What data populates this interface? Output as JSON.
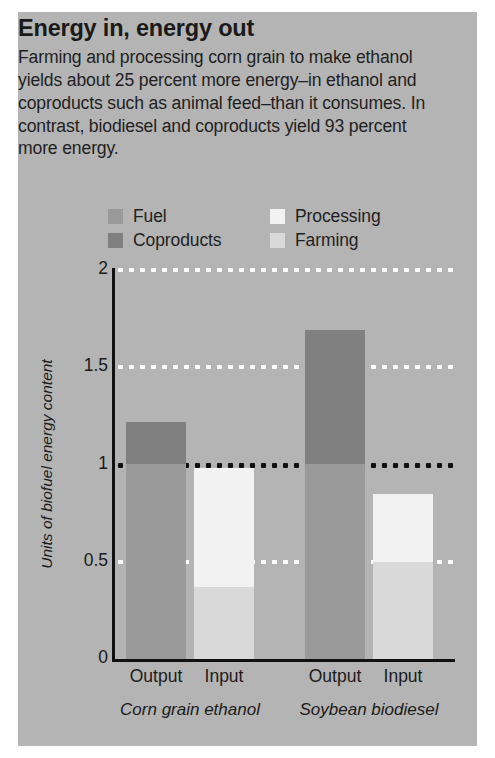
{
  "panel": {
    "background_color": "#b4b4b4"
  },
  "headline": {
    "title": "Energy in, energy out",
    "body": "Farming and processing corn grain to make ethanol yields about 25 percent more energy–in ethanol and coproducts such as animal feed–than it consumes. In contrast, biodiesel and coproducts yield 93 percent more energy."
  },
  "chart_data": {
    "type": "bar",
    "subtype": "stacked",
    "title": "Energy in, energy out",
    "xlabel": "",
    "ylabel": "Units of biofuel energy content",
    "ylim": [
      0,
      2
    ],
    "yticks": [
      "0",
      "0.5",
      "1",
      "1.5",
      "2"
    ],
    "ytick_values": [
      0,
      0.5,
      1,
      1.5,
      2
    ],
    "grid": true,
    "gridlines": [
      {
        "value": 2,
        "color": "#ffffff",
        "style": "dotted"
      },
      {
        "value": 1.5,
        "color": "#ffffff",
        "style": "dotted"
      },
      {
        "value": 1,
        "color": "#111111",
        "style": "dotted"
      },
      {
        "value": 0.5,
        "color": "#ffffff",
        "style": "dotted"
      }
    ],
    "legend_position": "above-plot",
    "legend": [
      {
        "label": "Fuel",
        "color": "#9a9a9a"
      },
      {
        "label": "Coproducts",
        "color": "#808080"
      },
      {
        "label": "Processing",
        "color": "#f2f2f2"
      },
      {
        "label": "Farming",
        "color": "#d9d9d9"
      }
    ],
    "groups": [
      {
        "name": "Corn grain ethanol",
        "bars": [
          {
            "label": "Output",
            "total": 1.22,
            "segments": [
              {
                "name": "Fuel",
                "value": 1.0,
                "color": "#9a9a9a"
              },
              {
                "name": "Coproducts",
                "value": 0.22,
                "color": "#808080"
              }
            ]
          },
          {
            "label": "Input",
            "total": 0.98,
            "segments": [
              {
                "name": "Farming",
                "value": 0.37,
                "color": "#d9d9d9"
              },
              {
                "name": "Processing",
                "value": 0.61,
                "color": "#f2f2f2"
              }
            ]
          }
        ]
      },
      {
        "name": "Soybean biodiesel",
        "bars": [
          {
            "label": "Output",
            "total": 1.69,
            "segments": [
              {
                "name": "Fuel",
                "value": 1.0,
                "color": "#9a9a9a"
              },
              {
                "name": "Coproducts",
                "value": 0.69,
                "color": "#808080"
              }
            ]
          },
          {
            "label": "Input",
            "total": 0.85,
            "segments": [
              {
                "name": "Farming",
                "value": 0.5,
                "color": "#d9d9d9"
              },
              {
                "name": "Processing",
                "value": 0.35,
                "color": "#f2f2f2"
              }
            ]
          }
        ]
      }
    ]
  }
}
